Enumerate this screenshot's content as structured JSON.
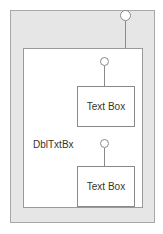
{
  "diagram": {
    "container_label": "DblTxtBx",
    "text_boxes": [
      {
        "label": "Text Box"
      },
      {
        "label": "Text Box"
      }
    ],
    "colors": {
      "outer_fill": "#e6e6e6",
      "inner_fill": "#ffffff",
      "stroke": "#8a8a8a"
    }
  }
}
